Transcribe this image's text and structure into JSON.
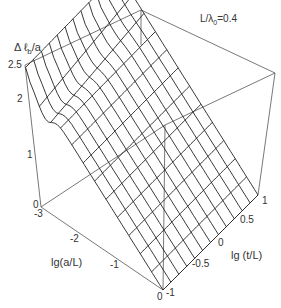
{
  "chart_data": {
    "type": "surface3d",
    "title": "",
    "annotation": "L/λ0=0.4",
    "annotation_parts": {
      "base": "L/λ",
      "sub": "0",
      "rest": "=0.4"
    },
    "zlabel": "Δℓb/a",
    "zlabel_parts": {
      "pre": "Δ ℓ",
      "sub": "b",
      "post": "/a"
    },
    "xlabel": "lg(a/L)",
    "ylabel": "lg (t/L)",
    "x_ticks": [
      "-3",
      "-2",
      "-1",
      "0"
    ],
    "y_ticks": [
      "-1",
      "-0.5",
      "0",
      "0.5",
      "1"
    ],
    "z_ticks": [
      "0",
      "1",
      "2",
      "2.5"
    ],
    "xlim": [
      -3,
      0
    ],
    "ylim": [
      -1,
      1
    ],
    "zlim": [
      0,
      2.5
    ],
    "grid": false,
    "mesh": {
      "nx": 13,
      "ny": 13
    },
    "samples": [
      {
        "lg_a_L": -3.0,
        "lg_t_L": -1,
        "value": 2.5
      },
      {
        "lg_a_L": -2.5,
        "lg_t_L": 0,
        "value": 2.1
      },
      {
        "lg_a_L": -2.0,
        "lg_t_L": 0,
        "value": 1.65
      },
      {
        "lg_a_L": -1.5,
        "lg_t_L": 0,
        "value": 1.2
      },
      {
        "lg_a_L": -1.0,
        "lg_t_L": 0,
        "value": 0.8
      },
      {
        "lg_a_L": -0.5,
        "lg_t_L": 0,
        "value": 0.4
      },
      {
        "lg_a_L": 0.0,
        "lg_t_L": 0,
        "value": 0.0
      },
      {
        "lg_a_L": -3.0,
        "lg_t_L": 1,
        "value": 2.5
      },
      {
        "lg_a_L": 0.0,
        "lg_t_L": 1,
        "value": 0.0
      }
    ]
  }
}
